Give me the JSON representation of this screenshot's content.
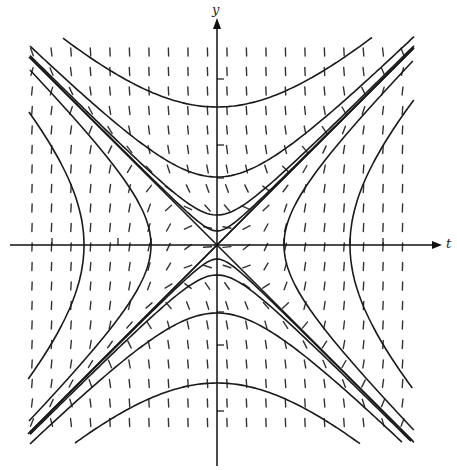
{
  "diagram": {
    "type": "slope-field",
    "axes": {
      "x_label": "t",
      "y_label": "y",
      "origin_px": [
        217,
        245
      ],
      "t_axis_px": [
        10,
        442
      ],
      "y_axis_px": [
        18,
        466
      ],
      "tick_spacing_px": 66,
      "ticks_t_px": [
        52,
        118,
        151,
        284,
        350,
        383
      ],
      "ticks_y_px": [
        79,
        145,
        178,
        312,
        345,
        411
      ]
    },
    "slope_field": {
      "x_range_px": [
        32,
        412
      ],
      "y_range_px": [
        52,
        440
      ],
      "spacing_px": 19.5,
      "mark_length_px": 8,
      "slope_rule": "k*(t^2 - y^2)",
      "k": 0.0009,
      "color": "#333333"
    },
    "solution_curves": {
      "color": "#1a1a1a",
      "diagonals": true,
      "top_vertices_px": [
        107,
        177
      ],
      "bottom_vertices_px": [
        313,
        383
      ],
      "left_vertices_px": [
        84,
        151
      ],
      "right_vertices_px": [
        284,
        350
      ],
      "near_asymptote_offsets_px": [
        14,
        30
      ]
    }
  }
}
